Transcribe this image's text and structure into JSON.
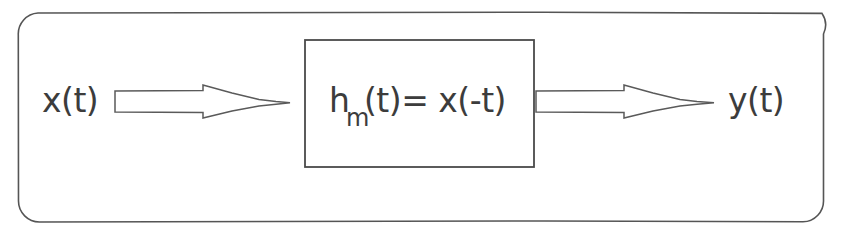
{
  "diagram": {
    "type": "block-diagram",
    "frame": {
      "shape": "rounded-rectangle",
      "stroke_color": "#555555"
    },
    "input": {
      "label": "x(t)"
    },
    "output": {
      "label": "y(t)"
    },
    "block": {
      "expression_main_1": "h",
      "expression_subscript": "m",
      "expression_main_2": "(t)= x(-t)",
      "full_expression": "h_m(t) = x(-t)",
      "stroke_color": "#4a4a4a"
    },
    "arrows": [
      {
        "name": "input-arrow",
        "direction": "right",
        "style": "hollow-block-arrow"
      },
      {
        "name": "output-arrow",
        "direction": "right",
        "style": "hollow-block-arrow"
      }
    ],
    "colors": {
      "background": "#ffffff",
      "ink": "#3c3c3c",
      "line": "#555555"
    }
  }
}
